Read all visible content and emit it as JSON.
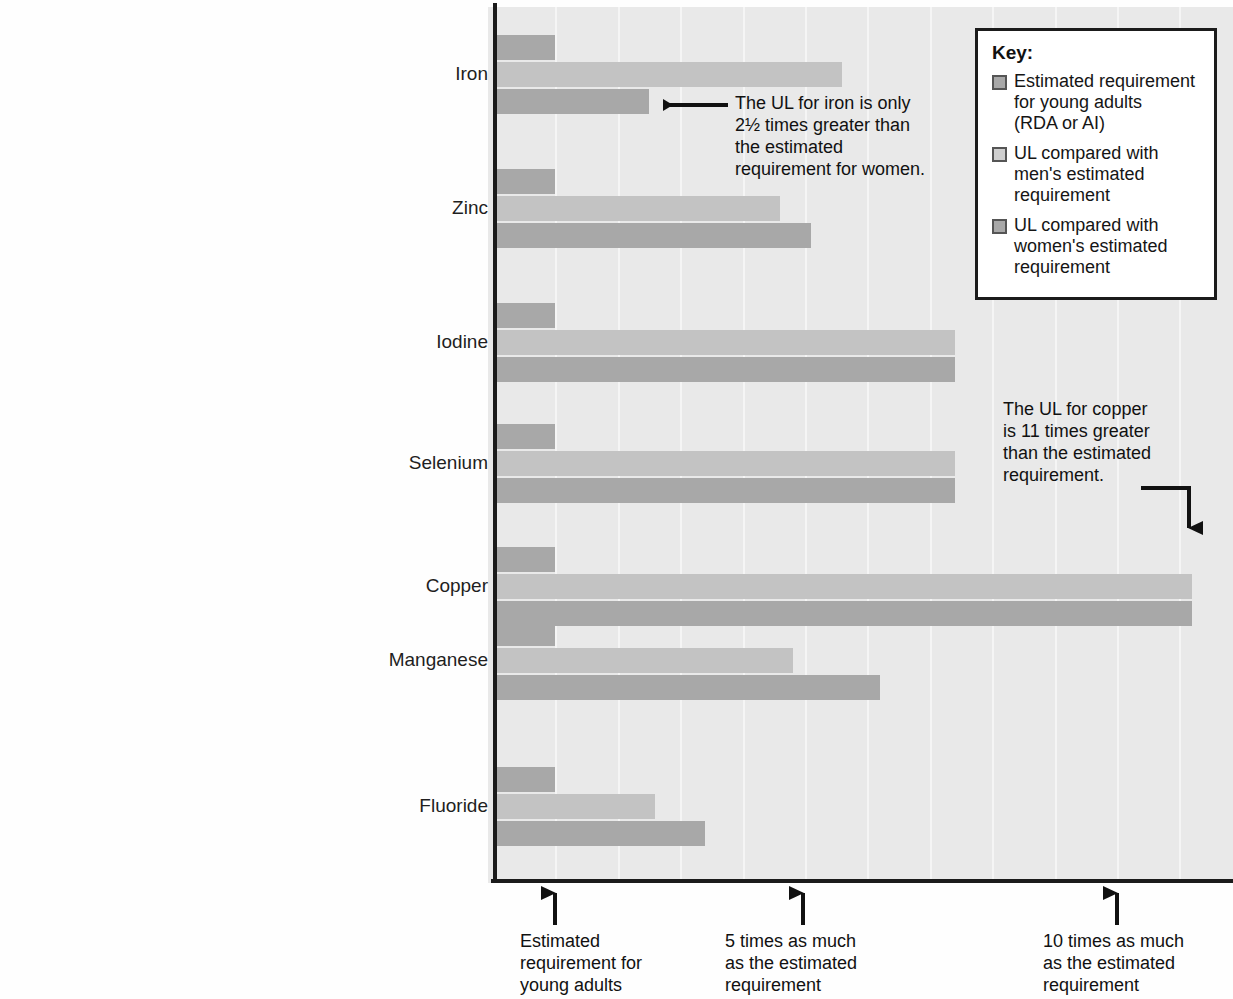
{
  "chart_data": {
    "type": "bar",
    "orientation": "horizontal",
    "title": "",
    "xlabel": "Multiples of the estimated requirement",
    "ylabel": "",
    "xlim": [
      0,
      12.0
    ],
    "grid": true,
    "legend_position": "top-right",
    "categories": [
      "Iron",
      "Zinc",
      "Iodine",
      "Selenium",
      "Copper",
      "Manganese",
      "Fluoride"
    ],
    "series": [
      {
        "name": "Estimated requirement for young adults (RDA or AI)",
        "color": "#a8a8a8",
        "values": [
          1.0,
          1.0,
          1.0,
          1.0,
          1.0,
          1.0,
          1.0
        ]
      },
      {
        "name": "UL compared with men's estimated requirement",
        "color": "#c3c3c3",
        "values": [
          5.6,
          4.6,
          7.4,
          7.4,
          11.2,
          4.8,
          2.6
        ]
      },
      {
        "name": "UL compared with women's estimated requirement",
        "color": "#a8a8a8",
        "values": [
          2.5,
          5.1,
          7.4,
          7.4,
          11.2,
          6.2,
          3.4
        ]
      }
    ],
    "x_tick_positions": [
      1,
      5,
      10
    ],
    "x_tick_labels": [
      "Estimated\nrequirement for\nyoung adults",
      "5 times as much\nas the estimated\nrequirement",
      "10 times as much\nas the estimated\nrequirement"
    ],
    "annotations": [
      {
        "id": "iron",
        "text": "The UL for iron is only\n2½ times greater than\nthe estimated\nrequirement for women.",
        "points_to": "Iron — UL compared with women's estimated requirement",
        "arrow": "left"
      },
      {
        "id": "copper",
        "text": "The UL for copper\nis 11 times greater\nthan the estimated\nrequirement.",
        "points_to": "Copper — UL bars end",
        "arrow": "elbow-down"
      }
    ]
  },
  "key": {
    "title": "Key:",
    "items": [
      {
        "swatch": "est",
        "label": "Estimated requirement\nfor young adults\n(RDA or AI)"
      },
      {
        "swatch": "ulmen",
        "label": "UL compared with\nmen's estimated\nrequirement"
      },
      {
        "swatch": "ulwom",
        "label": "UL compared with\nwomen's estimated\nrequirement"
      }
    ]
  },
  "colors": {
    "estimated": "#a8a8a8",
    "ul_men": "#c3c3c3",
    "ul_women": "#a8a8a8",
    "plot_background": "#e9e9e9",
    "axis": "#1b1b1b"
  }
}
